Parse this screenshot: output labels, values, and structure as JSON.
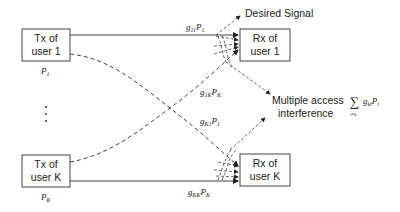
{
  "diagram": {
    "tx_boxes": [
      {
        "line1": "Tx of",
        "line2": "user 1",
        "power": "P",
        "power_sub": "1"
      },
      {
        "line1": "Tx of",
        "line2": "user K",
        "power": "P",
        "power_sub": "K"
      }
    ],
    "rx_boxes": [
      {
        "line1": "Rx of",
        "line2": "user 1"
      },
      {
        "line1": "Rx of",
        "line2": "user K"
      }
    ],
    "ellipsis": "⋮",
    "labels": {
      "g11P1": {
        "g": "g",
        "g_sub": "11",
        "p": "P",
        "p_sub": "1"
      },
      "g1KPK": {
        "g": "g",
        "g_sub": "1K",
        "p": "P",
        "p_sub": "K"
      },
      "gK1P1": {
        "g": "g",
        "g_sub": "K1",
        "p": "P",
        "p_sub": "1"
      },
      "gKKPK": {
        "g": "g",
        "g_sub": "KK",
        "p": "P",
        "p_sub": "K"
      }
    },
    "desired_signal": "Desired Signal",
    "mai_line1": "Multiple access",
    "mai_line2": "interference",
    "mai_formula": {
      "sum": "∑",
      "sum_sub": "i≠k",
      "g": "g",
      "g_sub": "ki",
      "p": "P",
      "p_sub": "i"
    }
  }
}
